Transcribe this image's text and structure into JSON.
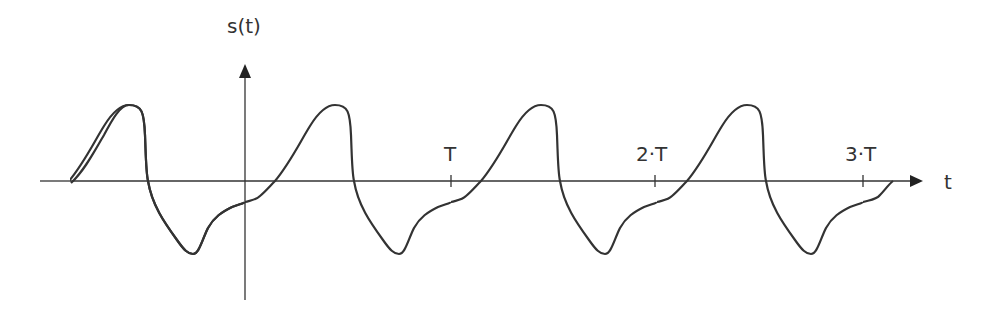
{
  "diagram": {
    "type": "periodic-signal",
    "y_axis_label": "s(t)",
    "x_axis_label": "t",
    "ticks": [
      {
        "label": "T",
        "x": 451
      },
      {
        "label": "2·T",
        "x": 655
      },
      {
        "label": "3·T",
        "x": 863
      }
    ],
    "line_color": "#333333",
    "period_px": 206
  }
}
